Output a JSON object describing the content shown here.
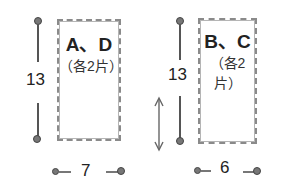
{
  "pieces": [
    {
      "label": "A、D",
      "quantity": "（各2片）",
      "height_dim": "13",
      "width_dim": "7"
    },
    {
      "label": "B、C",
      "quantity": "（各2片）",
      "height_dim": "13",
      "width_dim": "6"
    }
  ],
  "colors": {
    "line": "#555555",
    "dashed_border": "#8a8a8a",
    "text": "#222222"
  }
}
